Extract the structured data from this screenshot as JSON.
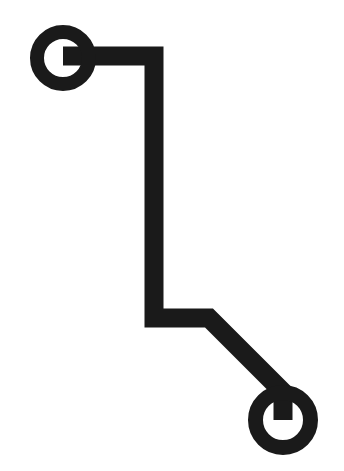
{
  "image": {
    "title": "Two-node connector pictogram",
    "kind": "line-art-glyph",
    "width": 344,
    "height": 471,
    "background_color": "#ffffff",
    "ink_color": "#1a1a1a"
  },
  "figure": {
    "stroke_width": 19,
    "nodes": [
      {
        "name": "top-left-node",
        "label": "Top left terminal ring",
        "cx": 63,
        "cy": 58,
        "outer_radius": 33,
        "inner_radius": 19,
        "ring_thickness": 14
      },
      {
        "name": "bottom-right-node",
        "label": "Bottom right terminal ring",
        "cx": 283,
        "cy": 420,
        "outer_radius": 35,
        "inner_radius": 20,
        "ring_thickness": 15
      }
    ],
    "connector": {
      "name": "connector-polyline",
      "label": "Elbowed connector line linking the two rings",
      "points": "63,56 154,56 154,318 209,318 283,392 283,420",
      "segments": [
        {
          "name": "segment-horizontal-top",
          "from": "63,56",
          "to": "154,56",
          "direction": "horizontal"
        },
        {
          "name": "segment-vertical-middle",
          "from": "154,56",
          "to": "154,318",
          "direction": "vertical"
        },
        {
          "name": "segment-horizontal-bottom",
          "from": "154,318",
          "to": "209,318",
          "direction": "horizontal"
        },
        {
          "name": "segment-diagonal-end",
          "from": "209,318",
          "to": "283,392",
          "direction": "diagonal"
        },
        {
          "name": "segment-stub-to-node",
          "from": "283,392",
          "to": "283,420",
          "direction": "vertical"
        }
      ]
    }
  }
}
